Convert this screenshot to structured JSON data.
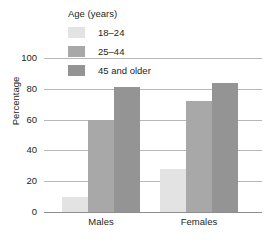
{
  "chart_data": {
    "type": "bar",
    "title": "",
    "xlabel": "",
    "ylabel": "Percentage",
    "ylim": [
      0,
      100
    ],
    "yticks": [
      0,
      20,
      40,
      60,
      80,
      100
    ],
    "grid": true,
    "legend_title": "Age (years)",
    "legend_position": "top-center",
    "categories": [
      "Males",
      "Females"
    ],
    "series": [
      {
        "name": "18–24",
        "color": "#e3e3e3",
        "values": [
          10,
          28
        ]
      },
      {
        "name": "25–44",
        "color": "#a8a8a8",
        "values": [
          60,
          72
        ]
      },
      {
        "name": "45 and older",
        "color": "#949494",
        "values": [
          81,
          84
        ]
      }
    ]
  },
  "axis": {
    "y_label": "Percentage",
    "y_tick_labels": [
      "0",
      "20",
      "40",
      "60",
      "80",
      "100"
    ],
    "x_tick_labels": [
      "Males",
      "Females"
    ]
  },
  "legend": {
    "title": "Age (years)",
    "items": [
      {
        "label": "18–24",
        "swatch": "#e3e3e3"
      },
      {
        "label": "25–44",
        "swatch": "#a8a8a8"
      },
      {
        "label": "45 and older",
        "swatch": "#949494"
      }
    ]
  },
  "colors": {
    "background": "#ffffff",
    "gridline": "#b7b7b7",
    "axis": "#8d8d8d",
    "text": "#231f20"
  }
}
